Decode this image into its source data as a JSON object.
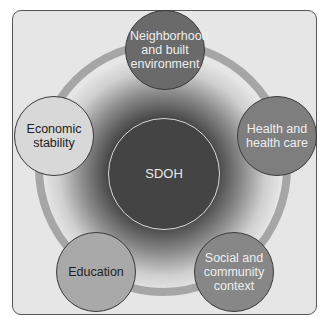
{
  "diagram": {
    "center": {
      "label": "SDOH",
      "color": "#444444"
    },
    "nodes": [
      {
        "id": "neighborhood",
        "label": "Neighborhood and built environment",
        "color": "#6a6a6a"
      },
      {
        "id": "health",
        "label": "Health and health care",
        "color": "#7e7e7e"
      },
      {
        "id": "social",
        "label": "Social and community context",
        "color": "#878787"
      },
      {
        "id": "education",
        "label": "Education",
        "color": "#a9a9a9"
      },
      {
        "id": "economic",
        "label": "Economic stability",
        "color": "#d8d8d8"
      }
    ],
    "ring_color": "#a6a6a6",
    "frame_background": "#e6e6e6"
  }
}
